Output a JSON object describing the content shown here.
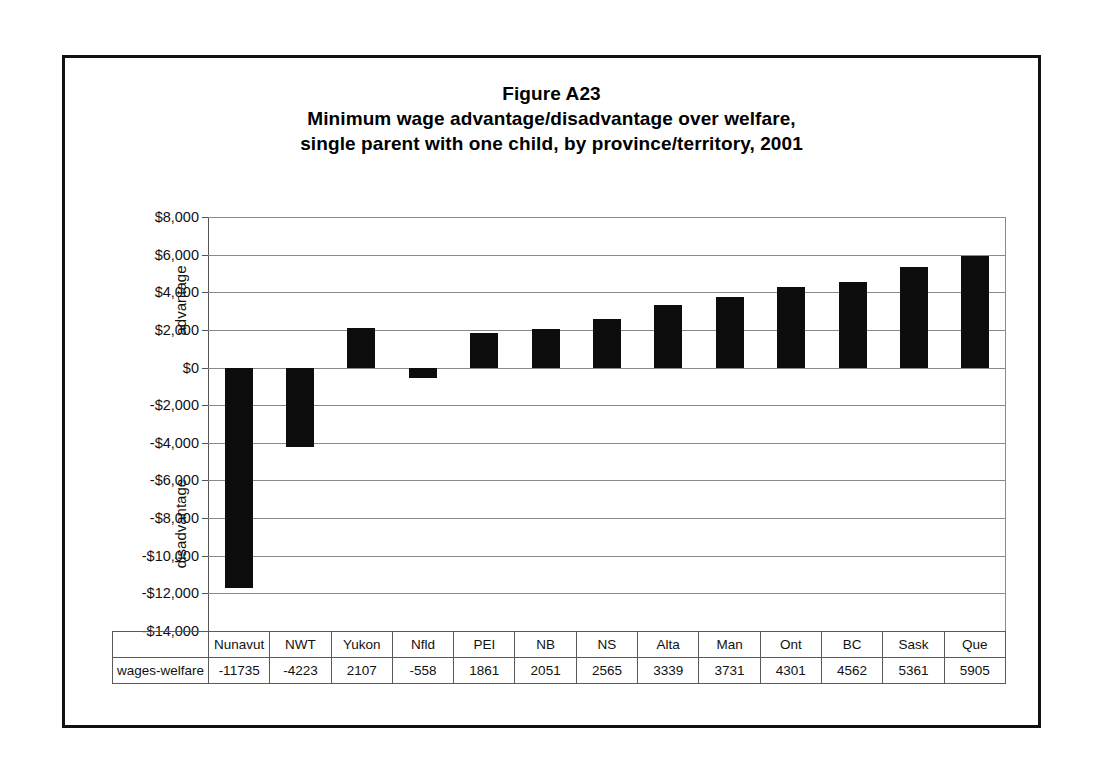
{
  "figure": {
    "title_line1": "Figure A23",
    "title_line2": "Minimum wage advantage/disadvantage over welfare,",
    "title_line3": "single parent with one child, by province/territory, 2001"
  },
  "axis": {
    "advantage_label": "advantage",
    "disadvantage_label": "disadvantage",
    "tick_labels": [
      "$8,000",
      "$6,000",
      "$4,000",
      "$2,000",
      "$0",
      "-$2,000",
      "-$4,000",
      "-$6,000",
      "-$8,000",
      "-$10,000",
      "-$12,000",
      "-$14,000"
    ]
  },
  "table": {
    "row_label": "wages-welfare",
    "headers": [
      "Nunavut",
      "NWT",
      "Yukon",
      "Nfld",
      "PEI",
      "NB",
      "NS",
      "Alta",
      "Man",
      "Ont",
      "BC",
      "Sask",
      "Que"
    ],
    "values": [
      "-11735",
      "-4223",
      "2107",
      "-558",
      "1861",
      "2051",
      "2565",
      "3339",
      "3731",
      "4301",
      "4562",
      "5361",
      "5905"
    ]
  },
  "chart_data": {
    "type": "bar",
    "xlabel": "",
    "ylabel": "advantage / disadvantage",
    "categories": [
      "Nunavut",
      "NWT",
      "Yukon",
      "Nfld",
      "PEI",
      "NB",
      "NS",
      "Alta",
      "Man",
      "Ont",
      "BC",
      "Sask",
      "Que"
    ],
    "series": [
      {
        "name": "wages-welfare",
        "values": [
          -11735,
          -4223,
          2107,
          -558,
          1861,
          2051,
          2565,
          3339,
          3731,
          4301,
          4562,
          5361,
          5905
        ]
      }
    ],
    "ylim": [
      -14000,
      8000
    ],
    "ytick_values": [
      8000,
      6000,
      4000,
      2000,
      0,
      -2000,
      -4000,
      -6000,
      -8000,
      -10000,
      -12000,
      -14000
    ],
    "ytick_labels": [
      "$8,000",
      "$6,000",
      "$4,000",
      "$2,000",
      "$0",
      "-$2,000",
      "-$4,000",
      "-$6,000",
      "-$8,000",
      "-$10,000",
      "-$12,000",
      "-$14,000"
    ],
    "grid": true,
    "legend": "none",
    "bar_color": "#0d0d0d",
    "gridline_color": "#8a8a8a"
  }
}
